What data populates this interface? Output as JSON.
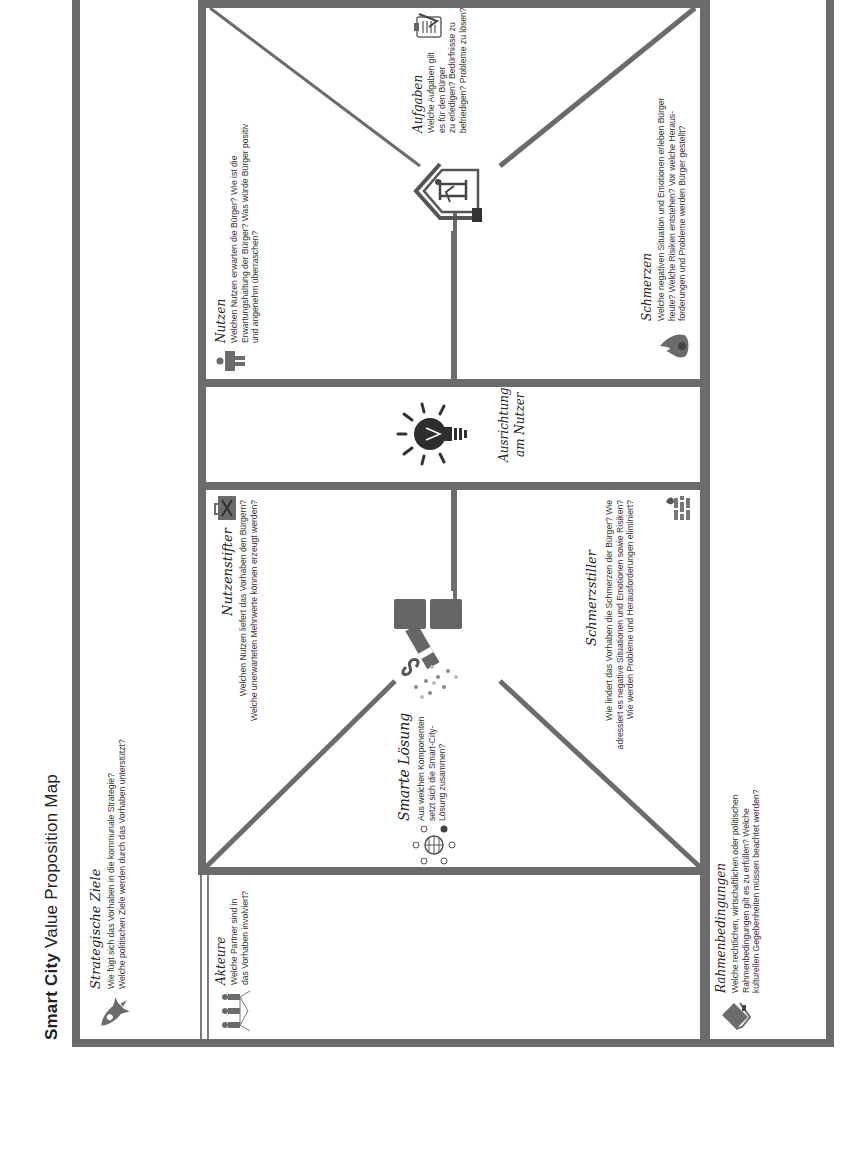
{
  "page": {
    "title_bold": "Smart",
    "title_city": "City",
    "title_rest": "Value Proposition Map",
    "rotation": "-90deg",
    "frame_color": "#6b6b6b"
  },
  "sections": {
    "strategische_ziele": {
      "heading": "Strategische Ziele",
      "icon": "rocket-icon",
      "lines": [
        "Wie fügt sich das Vorhaben in die kommunale Strategie?",
        "Welche politischen Ziele werden durch das Vorhaben unterstützt?"
      ]
    },
    "akteure": {
      "heading": "Akteure",
      "icon": "people-network-icon",
      "lines": [
        "Welche Partner sind in",
        "das Vorhaben involviert?"
      ]
    },
    "smarte_loesung": {
      "heading": "Smarte Lösung",
      "icon": "network-globe-icon",
      "lines": [
        "Aus welchen Komponenten",
        "setzt sich die Smart-City-",
        "Lösung zusammen?"
      ]
    },
    "nutzenstifter": {
      "heading": "Nutzenstifter",
      "icon": "toolbox-icon",
      "lines": [
        "Welchen Nutzen liefert das Vorhaben den Bürgern?",
        "Welche unerwarteten Mehrwerte können erzeugt werden?"
      ]
    },
    "schmerzstiller": {
      "heading": "Schmerzstiller",
      "icon": "firewall-icon",
      "lines": [
        "Wie lindert das Vorhaben die Schmerzen der Bürger? Wie",
        "adressiert es negative Situationen  und Emotionen sowie Risiken?",
        "Wie werden Probleme und Herausforderungen eliminiert?"
      ]
    },
    "ausrichtung": {
      "heading_line1": "Ausrichtung",
      "heading_line2": "am Nutzer",
      "icon": "lightbulb-icon"
    },
    "nutzen": {
      "heading": "Nutzen",
      "icon": "person-icon",
      "lines": [
        "Welchen Nutzen erwarten die Bürger? Wie ist die",
        "Erwartungshaltung der Bürger? Was würde Bürger positiv",
        "und angenehm überraschen?"
      ]
    },
    "aufgaben": {
      "heading": "Aufgaben",
      "icon": "clipboard-check-icon",
      "lines": [
        "Welche Aufgaben gilt",
        "es für den Bürger",
        "zu erledigen? Bedürfnisse zu",
        "befriedigen? Probleme zu lösen?"
      ]
    },
    "buerger": {
      "icon": "house-citizen-icon"
    },
    "schmerzen": {
      "heading": "Schmerzen",
      "icon": "flame-icon",
      "lines": [
        "Welche negativen Situation und Emotionen erleben Bürger",
        "heute? Welche Risiken entstehen? Vor welche Heraus-",
        "forderungen und Probleme werden Bürger gestellt?"
      ]
    },
    "rahmenbedingungen": {
      "heading": "Rahmenbedingungen",
      "icon": "book-icon",
      "lines": [
        "Welche rechtlichen, wirtschaftlichen oder politischen",
        "Rahmenbedingungen gilt es zu erfüllen? Welche",
        "kulturellen Gegebenheiten müssen beachtet werden?"
      ]
    }
  }
}
